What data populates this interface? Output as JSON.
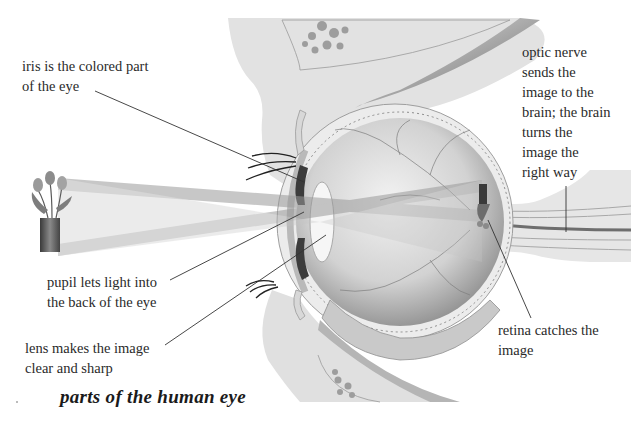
{
  "figure": {
    "caption": "parts of the human eye",
    "colors": {
      "background": "#ffffff",
      "tissue_light": "#e4e4e4",
      "tissue_mid": "#cfcfcf",
      "eyeball": "#d6d6d6",
      "light_beam": "#b9b9b9",
      "leader_line": "#333333",
      "text": "#2a2a2a"
    }
  },
  "labels": {
    "iris": {
      "lines": [
        "iris is the colored part",
        "of the eye"
      ]
    },
    "pupil": {
      "lines": [
        "pupil lets light into",
        "the back of the eye"
      ]
    },
    "lens": {
      "lines": [
        "lens makes the image",
        "clear and sharp"
      ]
    },
    "optic_nerve": {
      "lines": [
        "optic nerve",
        "sends the",
        "image to the",
        "brain; the brain",
        "turns the",
        "image the",
        "right way"
      ]
    },
    "retina": {
      "lines": [
        "retina catches the",
        "image"
      ]
    }
  },
  "objects": {
    "subject": "tulips-in-vase",
    "retinal_image": "inverted-tulips-in-vase"
  }
}
